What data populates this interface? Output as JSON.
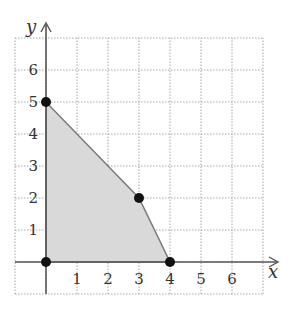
{
  "chart_data": {
    "type": "area",
    "title": "",
    "xlabel": "x",
    "ylabel": "y",
    "xlim": [
      -1,
      7
    ],
    "ylim": [
      -1,
      7
    ],
    "grid": true,
    "grid_style": "dotted",
    "x_ticks": [
      "1",
      "2",
      "3",
      "4",
      "5",
      "6"
    ],
    "y_ticks": [
      "1",
      "2",
      "3",
      "4",
      "5",
      "6"
    ],
    "region": {
      "name": "feasible region",
      "vertices": [
        [
          0,
          0
        ],
        [
          0,
          5
        ],
        [
          3,
          2
        ],
        [
          4,
          0
        ]
      ],
      "fill": "#d9d9d9",
      "edge": "#7a7a7a"
    },
    "points": [
      {
        "x": 0,
        "y": 0
      },
      {
        "x": 0,
        "y": 5
      },
      {
        "x": 3,
        "y": 2
      },
      {
        "x": 4,
        "y": 0
      }
    ]
  },
  "colors": {
    "axis": "#555555",
    "grid": "#a8a8a8",
    "point": "#111111",
    "text": "#333333"
  }
}
